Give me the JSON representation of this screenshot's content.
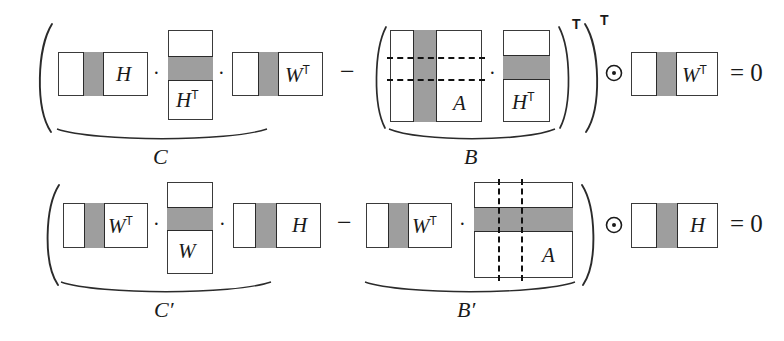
{
  "figure": {
    "kind": "matrix-equation-diagram",
    "colors": {
      "shade": "#9e9e9e",
      "box_border": "#3a3a3a",
      "band_border": "#2b2b2b",
      "dashed": "#111111",
      "background": "#ffffff",
      "ink": "#1a1a1a"
    },
    "operators": {
      "dot": "·",
      "minus": "−",
      "hadamard": "⊙",
      "equals_zero": "= 0",
      "transpose": "T",
      "paren_open": "(",
      "paren_close": ")"
    }
  },
  "rows": [
    {
      "id": "row-1",
      "equation_text": "( H · Hᵀ · Wᵀ − ( A · Hᵀ )ᵀ ) ⊙ Wᵀ = 0",
      "matrices": [
        {
          "name": "H",
          "base": "H",
          "sup": "",
          "shade": "vertical"
        },
        {
          "name": "HT1",
          "base": "H",
          "sup": "T",
          "shade": "horizontal"
        },
        {
          "name": "WT1",
          "base": "W",
          "sup": "T",
          "shade": "vertical"
        },
        {
          "name": "A1",
          "base": "A",
          "sup": "",
          "shade": "vertical",
          "dashed": "horizontal"
        },
        {
          "name": "HT2",
          "base": "H",
          "sup": "T",
          "shade": "horizontal"
        },
        {
          "name": "WT2",
          "base": "W",
          "sup": "T",
          "shade": "vertical"
        }
      ],
      "braces": [
        {
          "id": "brace-C",
          "label": "C",
          "covers": "H · Hᵀ · Wᵀ"
        },
        {
          "id": "brace-B",
          "label": "B",
          "covers": "A · Hᵀ"
        }
      ]
    },
    {
      "id": "row-2",
      "equation_text": "( Wᵀ · W · H − Wᵀ · A ) ⊙ H = 0",
      "matrices": [
        {
          "name": "WT3",
          "base": "W",
          "sup": "T",
          "shade": "vertical"
        },
        {
          "name": "W",
          "base": "W",
          "sup": "",
          "shade": "horizontal"
        },
        {
          "name": "H2",
          "base": "H",
          "sup": "",
          "shade": "vertical"
        },
        {
          "name": "WT4",
          "base": "W",
          "sup": "T",
          "shade": "vertical"
        },
        {
          "name": "A2",
          "base": "A",
          "sup": "",
          "shade": "horizontal",
          "dashed": "vertical"
        },
        {
          "name": "H3",
          "base": "H",
          "sup": "",
          "shade": "vertical"
        }
      ],
      "braces": [
        {
          "id": "brace-Cp",
          "label": "C′",
          "covers": "Wᵀ · W · H"
        },
        {
          "id": "brace-Bp",
          "label": "B′",
          "covers": "Wᵀ · A"
        }
      ]
    }
  ],
  "labels": {
    "H": "H",
    "W": "W",
    "A": "A",
    "T": "T",
    "C": "C",
    "B": "B",
    "Cp": "C′",
    "Bp": "B′",
    "dot": "·",
    "minus": "−",
    "eq0": "= 0"
  }
}
